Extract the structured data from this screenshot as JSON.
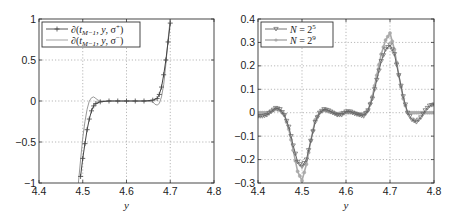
{
  "chart_data": [
    {
      "type": "line",
      "panel": "left",
      "title": "",
      "xlabel": "y",
      "ylabel": "",
      "xlim": [
        4.4,
        4.8
      ],
      "ylim": [
        -1,
        1
      ],
      "xticks": [
        "4.4",
        "4.5",
        "4.6",
        "4.7",
        "4.8"
      ],
      "yticks": [
        "1",
        "0.5",
        "0",
        "-0.5",
        "-1"
      ],
      "grid": true,
      "legend_position": "upper-left",
      "series": [
        {
          "name": "∂(t_{M-1}, y, σ⁺)",
          "marker": "+",
          "color": "#444444",
          "x": [
            4.495,
            4.5,
            4.505,
            4.51,
            4.515,
            4.52,
            4.525,
            4.53,
            4.54,
            4.56,
            4.58,
            4.6,
            4.62,
            4.64,
            4.66,
            4.67,
            4.675,
            4.68,
            4.685,
            4.69,
            4.695,
            4.7
          ],
          "y": [
            -0.92,
            -0.7,
            -0.52,
            -0.35,
            -0.22,
            -0.12,
            -0.06,
            -0.03,
            -0.01,
            0.0,
            0.0,
            0.0,
            0.0,
            0.0,
            0.01,
            0.03,
            0.08,
            0.17,
            0.32,
            0.5,
            0.72,
            0.95
          ]
        },
        {
          "name": "∂(t_{M-1}, y, σ⁻)",
          "marker": "none",
          "color": "#999999",
          "x": [
            4.49,
            4.495,
            4.5,
            4.505,
            4.51,
            4.515,
            4.52,
            4.525,
            4.53,
            4.535,
            4.54,
            4.56,
            4.6,
            4.64,
            4.66,
            4.665,
            4.67,
            4.675,
            4.68,
            4.685,
            4.69,
            4.695,
            4.7
          ],
          "y": [
            -1.0,
            -0.72,
            -0.45,
            -0.25,
            -0.1,
            0.0,
            0.04,
            0.05,
            0.03,
            0.01,
            0.0,
            0.0,
            0.0,
            0.0,
            -0.01,
            -0.04,
            -0.05,
            -0.03,
            0.05,
            0.2,
            0.45,
            0.75,
            1.0
          ]
        }
      ]
    },
    {
      "type": "line",
      "panel": "right",
      "title": "",
      "xlabel": "y",
      "ylabel": "",
      "xlim": [
        4.4,
        4.8
      ],
      "ylim": [
        -0.3,
        0.4
      ],
      "xticks": [
        "4.4",
        "4.5",
        "4.6",
        "4.7",
        "4.8"
      ],
      "yticks": [
        "0.4",
        "0.3",
        "0.2",
        "0.1",
        "0",
        "-0.1",
        "-0.2",
        "-0.3"
      ],
      "grid": true,
      "legend_position": "upper-left",
      "series": [
        {
          "name": "N = 2^5",
          "marker": "triangle-down",
          "color": "#666666",
          "x": [
            4.4,
            4.41,
            4.42,
            4.43,
            4.44,
            4.45,
            4.46,
            4.47,
            4.48,
            4.49,
            4.5,
            4.51,
            4.52,
            4.53,
            4.54,
            4.55,
            4.56,
            4.57,
            4.58,
            4.59,
            4.6,
            4.61,
            4.62,
            4.63,
            4.64,
            4.65,
            4.66,
            4.67,
            4.68,
            4.69,
            4.7,
            4.71,
            4.72,
            4.73,
            4.74,
            4.75,
            4.76,
            4.77,
            4.78,
            4.79,
            4.8
          ],
          "y": [
            -0.015,
            -0.015,
            -0.01,
            0.005,
            0.02,
            0.015,
            -0.01,
            -0.06,
            -0.14,
            -0.21,
            -0.23,
            -0.2,
            -0.12,
            -0.04,
            0.0,
            0.015,
            0.01,
            0.0,
            -0.01,
            -0.01,
            0.005,
            0.005,
            -0.005,
            -0.01,
            -0.015,
            0.01,
            0.06,
            0.14,
            0.22,
            0.27,
            0.29,
            0.25,
            0.16,
            0.07,
            0.0,
            -0.03,
            -0.04,
            -0.02,
            0.01,
            0.03,
            0.035
          ]
        },
        {
          "name": "N = 2^9",
          "marker": "star",
          "color": "#aaaaaa",
          "x": [
            4.4,
            4.41,
            4.42,
            4.43,
            4.44,
            4.45,
            4.46,
            4.47,
            4.48,
            4.49,
            4.5,
            4.51,
            4.52,
            4.53,
            4.54,
            4.55,
            4.56,
            4.57,
            4.58,
            4.59,
            4.6,
            4.61,
            4.62,
            4.63,
            4.64,
            4.65,
            4.66,
            4.67,
            4.68,
            4.69,
            4.7,
            4.71,
            4.72,
            4.73,
            4.74,
            4.75,
            4.76,
            4.77,
            4.78,
            4.79,
            4.8
          ],
          "y": [
            0.0,
            0.0,
            0.0,
            0.005,
            0.015,
            0.01,
            -0.01,
            -0.07,
            -0.16,
            -0.25,
            -0.29,
            -0.22,
            -0.12,
            -0.03,
            0.0,
            0.01,
            0.005,
            0.0,
            -0.005,
            0.0,
            0.0,
            0.0,
            0.0,
            -0.005,
            -0.005,
            0.01,
            0.07,
            0.16,
            0.25,
            0.31,
            0.34,
            0.27,
            0.16,
            0.06,
            0.0,
            0.0,
            0.0,
            0.0,
            0.0,
            0.0,
            0.0
          ]
        }
      ]
    }
  ]
}
